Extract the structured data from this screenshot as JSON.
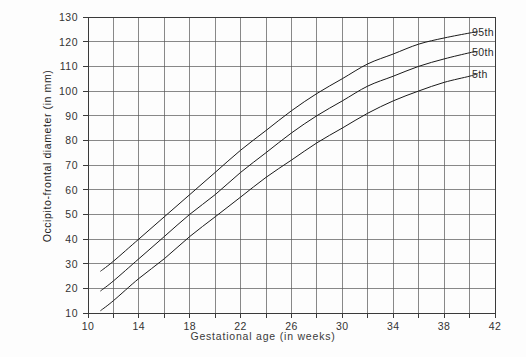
{
  "chart_data": {
    "type": "line",
    "title": "",
    "xlabel": "Gestational age (in weeks)",
    "ylabel": "Occipito-frontal diameter (in mm)",
    "xlim": [
      10,
      42
    ],
    "ylim": [
      10,
      130
    ],
    "xticks": [
      10,
      14,
      18,
      22,
      26,
      30,
      34,
      38,
      42
    ],
    "xtick_labels": [
      "10",
      "14",
      "18",
      "22",
      "26",
      "30",
      "34",
      "38",
      "42"
    ],
    "yticks": [
      10,
      20,
      30,
      40,
      50,
      60,
      70,
      80,
      90,
      100,
      110,
      120,
      130
    ],
    "ytick_labels": [
      "10",
      "20",
      "30",
      "40",
      "50",
      "60",
      "70",
      "80",
      "90",
      "100",
      "110",
      "120",
      "130"
    ],
    "x_minor_step": 2,
    "grid": true,
    "grid_color": "#555555",
    "legend_position": "right-inline",
    "x": [
      11,
      12,
      14,
      16,
      18,
      20,
      22,
      24,
      26,
      28,
      30,
      32,
      34,
      36,
      38,
      40,
      40.6
    ],
    "series": [
      {
        "name": "95th",
        "label": "95th",
        "color": "#1a1a1a",
        "values": [
          27,
          31,
          40,
          49,
          58,
          67,
          76,
          84,
          92,
          99,
          105,
          111,
          115,
          119,
          121.5,
          123.5,
          124
        ]
      },
      {
        "name": "50th",
        "label": "50th",
        "color": "#1a1a1a",
        "values": [
          19,
          23,
          32,
          41,
          50,
          58,
          67,
          75,
          83,
          90,
          96,
          102,
          106,
          110,
          113,
          115.5,
          116
        ]
      },
      {
        "name": "5th",
        "label": "5th",
        "color": "#1a1a1a",
        "values": [
          11,
          15,
          24,
          32,
          41,
          49,
          57,
          65,
          72,
          79,
          85,
          91,
          96,
          100,
          103.5,
          106,
          107
        ]
      }
    ]
  },
  "legend": {
    "items": [
      {
        "label": "95th"
      },
      {
        "label": "50th"
      },
      {
        "label": "5th"
      }
    ]
  }
}
